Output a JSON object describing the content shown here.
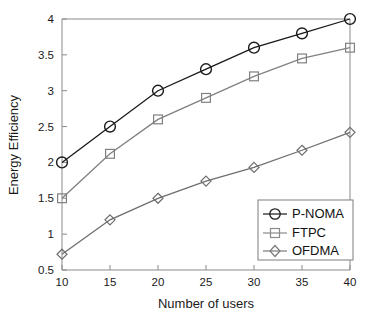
{
  "chart_data": {
    "type": "line",
    "title": "",
    "xlabel": "Number of users",
    "ylabel": "Energy Efficiency",
    "x": [
      10,
      15,
      20,
      25,
      30,
      35,
      40
    ],
    "xlim": [
      10,
      40
    ],
    "ylim": [
      0.5,
      4
    ],
    "xticks": [
      10,
      15,
      20,
      25,
      30,
      35,
      40
    ],
    "yticks": [
      0.5,
      1,
      1.5,
      2,
      2.5,
      3,
      3.5,
      4
    ],
    "xticklabels": [
      "10",
      "15",
      "20",
      "25",
      "30",
      "35",
      "40"
    ],
    "yticklabels": [
      "0.5",
      "1",
      "1.5",
      "2",
      "2.5",
      "3",
      "3.5",
      "4"
    ],
    "grid": false,
    "legend_position": "lower right",
    "series": [
      {
        "name": "P-NOMA",
        "marker": "circle",
        "color": "#1a1a1a",
        "values": [
          2.0,
          2.5,
          3.0,
          3.3,
          3.6,
          3.8,
          4.0
        ]
      },
      {
        "name": "FTPC",
        "marker": "square",
        "color": "#808080",
        "values": [
          1.5,
          2.12,
          2.6,
          2.9,
          3.2,
          3.45,
          3.6
        ]
      },
      {
        "name": "OFDMA",
        "marker": "diamond",
        "color": "#6e6e6e",
        "values": [
          0.72,
          1.2,
          1.5,
          1.74,
          1.93,
          2.17,
          2.42
        ]
      }
    ]
  },
  "axes": {
    "x_title": "Number of users",
    "y_title": "Energy Efficiency"
  },
  "legend": {
    "entries": [
      {
        "label": "P-NOMA",
        "marker": "circle-marker"
      },
      {
        "label": "FTPC",
        "marker": "square-marker"
      },
      {
        "label": "OFDMA",
        "marker": "diamond-marker"
      }
    ]
  },
  "ticks": {
    "x": [
      "10",
      "15",
      "20",
      "25",
      "30",
      "35",
      "40"
    ],
    "y": [
      "0.5",
      "1",
      "1.5",
      "2",
      "2.5",
      "3",
      "3.5",
      "4"
    ]
  },
  "colors": {
    "p_noma": "#1a1a1a",
    "ftpc": "#808080",
    "ofdma": "#6e6e6e",
    "axis": "#8a8a8a",
    "background": "#ffffff"
  }
}
